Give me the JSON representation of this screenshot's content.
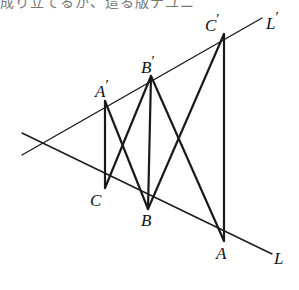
{
  "page": {
    "width": 299,
    "height": 290,
    "background": "#ffffff",
    "ink_color": "#1a1a1a"
  },
  "cut_text": {
    "content": "成り立てるか、這る版ナユニ",
    "note": "partially cropped line of Japanese body text at top edge"
  },
  "figure": {
    "type": "geometric-diagram",
    "vertex": {
      "x": 36,
      "y": 144
    },
    "lines": [
      {
        "name": "line-L",
        "label": "L",
        "from": {
          "x": 22,
          "y": 133
        },
        "to": {
          "x": 272,
          "y": 254
        },
        "label_pos": {
          "x": 274,
          "y": 250
        }
      },
      {
        "name": "line-L-prime",
        "label": "L",
        "prime": true,
        "from": {
          "x": 22,
          "y": 155
        },
        "to": {
          "x": 262,
          "y": 18
        },
        "label_pos": {
          "x": 266,
          "y": 10
        }
      }
    ],
    "points": [
      {
        "id": "C",
        "label": "C",
        "prime": false,
        "x": 105,
        "y": 188,
        "on": "line-L",
        "label_pos": {
          "x": 90,
          "y": 192
        }
      },
      {
        "id": "B",
        "label": "B",
        "prime": false,
        "x": 148,
        "y": 209,
        "on": "line-L",
        "label_pos": {
          "x": 141,
          "y": 212
        }
      },
      {
        "id": "A",
        "label": "A",
        "prime": false,
        "x": 224,
        "y": 241,
        "on": "line-L",
        "label_pos": {
          "x": 216,
          "y": 245
        }
      },
      {
        "id": "Ap",
        "label": "A",
        "prime": true,
        "x": 105,
        "y": 101,
        "on": "line-L-prime",
        "label_pos": {
          "x": 95,
          "y": 78
        }
      },
      {
        "id": "Bp",
        "label": "B",
        "prime": true,
        "x": 151,
        "y": 76,
        "on": "line-L-prime",
        "label_pos": {
          "x": 141,
          "y": 54
        }
      },
      {
        "id": "Cp",
        "label": "C",
        "prime": true,
        "x": 224,
        "y": 34,
        "on": "line-L-prime",
        "label_pos": {
          "x": 205,
          "y": 12
        }
      }
    ],
    "segments": [
      {
        "name": "segment-A-prime-C",
        "from": "Ap",
        "to": "C",
        "kind": "vertical"
      },
      {
        "name": "segment-B-prime-B",
        "from": "Bp",
        "to": "B",
        "kind": "vertical"
      },
      {
        "name": "segment-C-prime-A",
        "from": "Cp",
        "to": "A",
        "kind": "vertical"
      },
      {
        "name": "segment-A-prime-B",
        "from": "Ap",
        "to": "B",
        "kind": "diagonal"
      },
      {
        "name": "segment-B-prime-C",
        "from": "Bp",
        "to": "C",
        "kind": "diagonal"
      },
      {
        "name": "segment-B-prime-A",
        "from": "Bp",
        "to": "A",
        "kind": "diagonal"
      },
      {
        "name": "segment-C-prime-B",
        "from": "Cp",
        "to": "B",
        "kind": "diagonal"
      }
    ]
  }
}
